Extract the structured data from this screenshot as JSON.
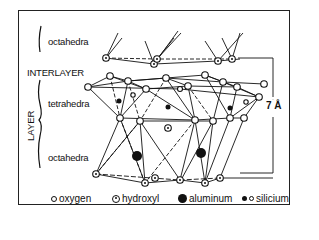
{
  "labels": {
    "octahedra_top": "octahedra",
    "interlayer": "INTERLAYER",
    "tetrahedra": "tetrahedra",
    "layer": "LAYER",
    "octahedra_bottom": "octahedra",
    "spacing": "7 Å"
  },
  "legend": [
    {
      "symbol": "open-circle",
      "label": "oxygen"
    },
    {
      "symbol": "dotted-circle",
      "label": "hydroxyl"
    },
    {
      "symbol": "large-filled-circle",
      "label": "aluminum"
    },
    {
      "symbol": "small-filled-and-open-circle",
      "label": "silicium"
    }
  ],
  "colors": {
    "line": "#111111",
    "background": "#ffffff"
  }
}
